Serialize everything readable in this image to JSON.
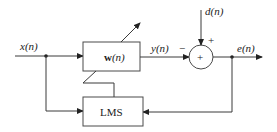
{
  "diagram": {
    "signals": {
      "input": "x(n)",
      "desired": "d(n)",
      "output": "y(n)",
      "error": "e(n)"
    },
    "blocks": {
      "filter": {
        "label_main": "w",
        "label_arg": "(n)"
      },
      "algorithm": {
        "label": "LMS"
      }
    },
    "summer": {
      "symbol": "+",
      "sign_desired": "+",
      "sign_output": "−"
    },
    "colors": {
      "line": "#3a3a3a",
      "text": "#222222",
      "background": "#ffffff"
    }
  }
}
